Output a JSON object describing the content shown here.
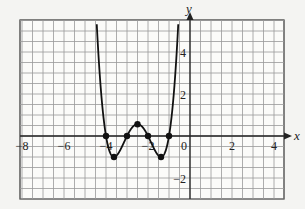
{
  "chart_data": {
    "type": "line",
    "title": "",
    "xlabel": "x",
    "ylabel": "y",
    "xlim": [
      -8.1,
      4.5
    ],
    "ylim": [
      -3,
      5.5
    ],
    "grid": true,
    "grid_step": 0.5,
    "x_ticks": [
      -8,
      -6,
      -4,
      -2,
      0,
      2,
      4
    ],
    "x_tick_labels": [
      "-8",
      "-6",
      "-4",
      "-2",
      "0",
      "2",
      "4"
    ],
    "y_ticks": [
      4,
      2,
      -2
    ],
    "y_tick_labels": [
      "4",
      "2",
      "-2"
    ],
    "function": "y = (x+1)(x+2)(x+3)(x+4)",
    "marked_points": [
      {
        "x": -4,
        "y": 0
      },
      {
        "x": -3.62,
        "y": -1
      },
      {
        "x": -3,
        "y": 0
      },
      {
        "x": -2.5,
        "y": 0.5625
      },
      {
        "x": -2,
        "y": 0
      },
      {
        "x": -1.38,
        "y": -1
      },
      {
        "x": -1,
        "y": 0
      }
    ]
  },
  "labels": {
    "x_axis": "x",
    "y_axis": "y",
    "xt0": "−8",
    "xt1": "−6",
    "xt2": "−4",
    "xt3": "−2",
    "xt4": "0",
    "xt5": "2",
    "xt6": "4",
    "yt0": "4",
    "yt1": "2",
    "yt2": "−2"
  }
}
